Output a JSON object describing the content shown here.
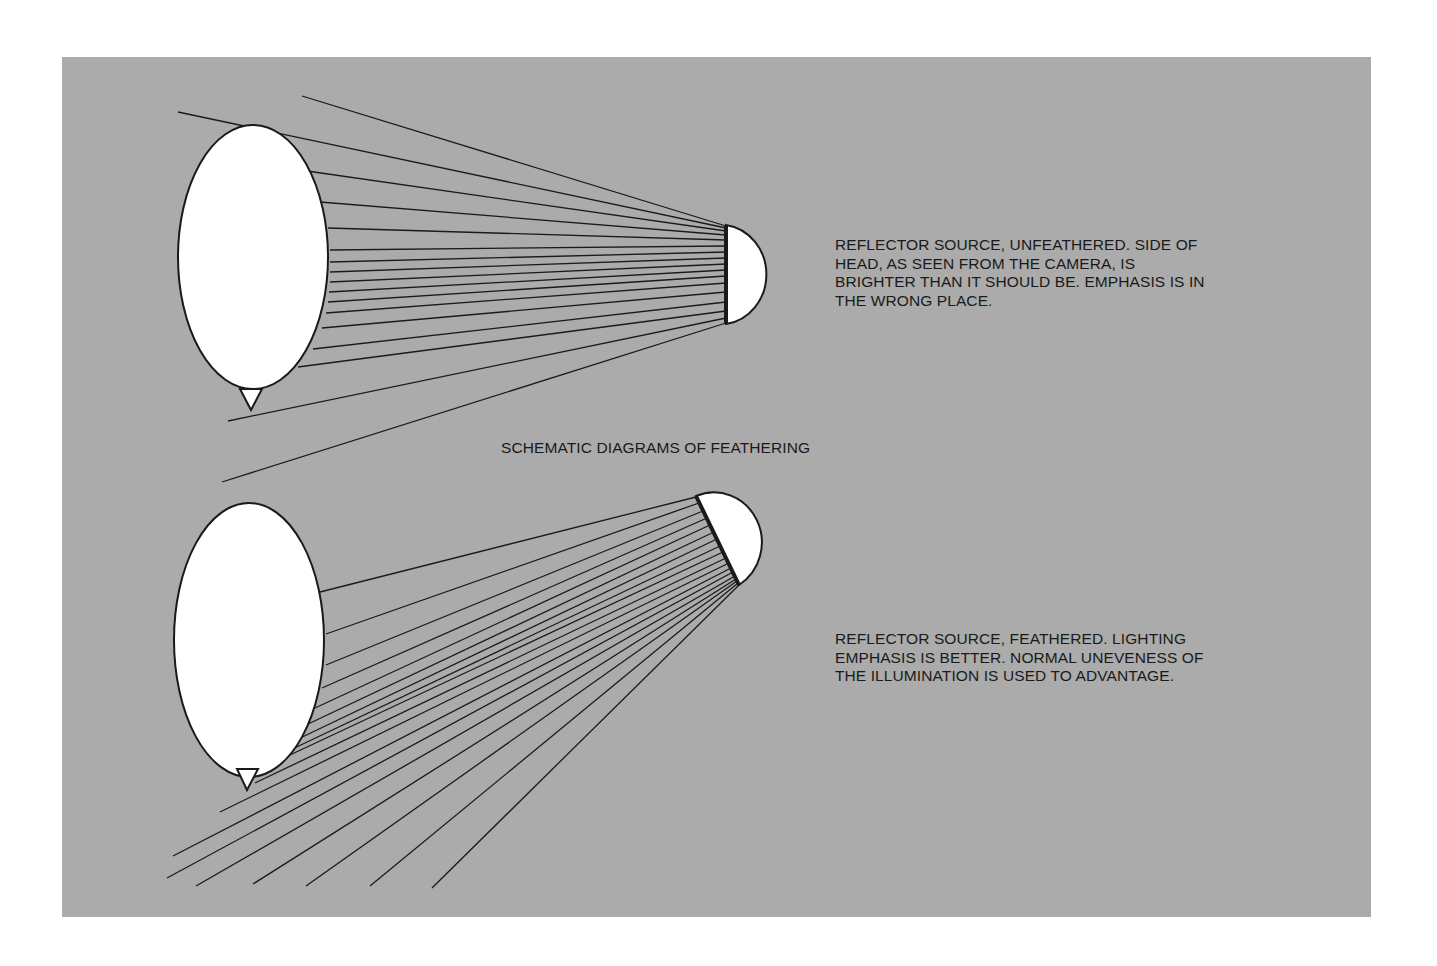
{
  "title": "SCHEMATIC DIAGRAMS OF FEATHERING",
  "colors": {
    "panel": "#ababab",
    "page": "#ffffff",
    "ink": "#1a1a1a",
    "shape_fill": "#ffffff"
  },
  "diagrams": [
    {
      "id": "unfeathered",
      "caption": "REFLECTOR SOURCE, UNFEATHERED. SIDE OF\nHEAD, AS SEEN FROM THE CAMERA, IS\nBRIGHTER THAN IT SHOULD BE. EMPHASIS IS IN\nTHE WRONG PLACE.",
      "head": {
        "cx": 253,
        "cy": 257,
        "rx": 75,
        "ry": 132
      },
      "nose": [
        [
          240,
          389
        ],
        [
          262,
          389
        ],
        [
          251,
          410
        ]
      ],
      "reflector": {
        "face_x": 726,
        "top_y": 225,
        "bottom_y": 324,
        "type": "semicircle-right"
      },
      "rays": [
        {
          "from": [
            302,
            96
          ],
          "to": [
            726,
            226
          ]
        },
        {
          "from": [
            178,
            112
          ],
          "to": [
            726,
            228
          ]
        },
        {
          "from": [
            300,
            170
          ],
          "to": [
            726,
            231
          ]
        },
        {
          "from": [
            320,
            202
          ],
          "to": [
            726,
            235
          ]
        },
        {
          "from": [
            328,
            228
          ],
          "to": [
            726,
            240
          ]
        },
        {
          "from": [
            330,
            250
          ],
          "to": [
            726,
            246
          ]
        },
        {
          "from": [
            330,
            262
          ],
          "to": [
            726,
            252
          ]
        },
        {
          "from": [
            330,
            272
          ],
          "to": [
            726,
            258
          ]
        },
        {
          "from": [
            330,
            282
          ],
          "to": [
            726,
            264
          ]
        },
        {
          "from": [
            329,
            292
          ],
          "to": [
            726,
            270
          ]
        },
        {
          "from": [
            328,
            302
          ],
          "to": [
            726,
            276
          ]
        },
        {
          "from": [
            326,
            313
          ],
          "to": [
            726,
            283
          ]
        },
        {
          "from": [
            322,
            328
          ],
          "to": [
            726,
            292
          ]
        },
        {
          "from": [
            313,
            349
          ],
          "to": [
            726,
            302
          ]
        },
        {
          "from": [
            298,
            367
          ],
          "to": [
            726,
            311
          ]
        },
        {
          "from": [
            228,
            421
          ],
          "to": [
            726,
            318
          ]
        },
        {
          "from": [
            222,
            482
          ],
          "to": [
            726,
            323
          ]
        }
      ]
    },
    {
      "id": "feathered",
      "caption": "REFLECTOR SOURCE, FEATHERED. LIGHTING\nEMPHASIS IS BETTER. NORMAL UNEVENESS OF\nTHE ILLUMINATION IS USED TO ADVANTAGE.",
      "head": {
        "cx": 249,
        "cy": 640,
        "rx": 75,
        "ry": 137
      },
      "nose": [
        [
          237,
          769
        ],
        [
          258,
          769
        ],
        [
          247,
          790
        ]
      ],
      "reflector": {
        "face_top": [
          696,
          496
        ],
        "face_bottom": [
          739,
          585
        ],
        "type": "semicircle-tilted"
      },
      "rays": [
        {
          "from": [
            320,
            592
          ],
          "to": [
            696,
            497
          ]
        },
        {
          "from": [
            326,
            634
          ],
          "to": [
            699,
            503
          ]
        },
        {
          "from": [
            326,
            665
          ],
          "to": [
            703,
            511
          ]
        },
        {
          "from": [
            322,
            688
          ],
          "to": [
            707,
            518
          ]
        },
        {
          "from": [
            315,
            708
          ],
          "to": [
            710,
            525
          ]
        },
        {
          "from": [
            306,
            725
          ],
          "to": [
            714,
            532
          ]
        },
        {
          "from": [
            296,
            740
          ],
          "to": [
            717,
            539
          ]
        },
        {
          "from": [
            286,
            752
          ],
          "to": [
            720,
            546
          ]
        },
        {
          "from": [
            275,
            762
          ],
          "to": [
            723,
            552
          ]
        },
        {
          "from": [
            255,
            783
          ],
          "to": [
            726,
            558
          ]
        },
        {
          "from": [
            220,
            812
          ],
          "to": [
            729,
            563
          ]
        },
        {
          "from": [
            173,
            856
          ],
          "to": [
            731,
            568
          ]
        },
        {
          "from": [
            167,
            878
          ],
          "to": [
            733,
            572
          ]
        },
        {
          "from": [
            196,
            886
          ],
          "to": [
            735,
            576
          ]
        },
        {
          "from": [
            253,
            884
          ],
          "to": [
            736,
            579
          ]
        },
        {
          "from": [
            306,
            886
          ],
          "to": [
            737,
            581
          ]
        },
        {
          "from": [
            370,
            886
          ],
          "to": [
            738,
            583
          ]
        },
        {
          "from": [
            432,
            888
          ],
          "to": [
            739,
            585
          ]
        }
      ]
    }
  ]
}
